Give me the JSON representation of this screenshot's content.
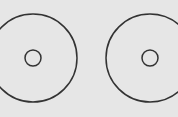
{
  "canvas": {
    "width": 178,
    "height": 117,
    "background": "#e6e6e6"
  },
  "stroke_color": "#333333",
  "discs": [
    {
      "name": "left-disc",
      "cx": 33,
      "cy": 58,
      "outer_r": 44,
      "inner_r": 8
    },
    {
      "name": "right-disc",
      "cx": 150,
      "cy": 58,
      "outer_r": 44,
      "inner_r": 8
    }
  ]
}
